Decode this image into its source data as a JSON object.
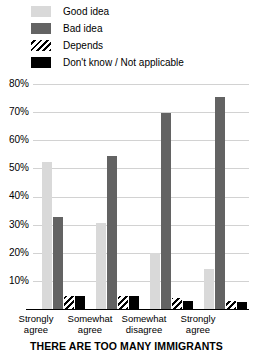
{
  "chart_data": {
    "type": "bar",
    "title": "",
    "xlabel": "THERE ARE TOO MANY IMMIGRANTS",
    "ylabel": "",
    "ylim": [
      0,
      84
    ],
    "yticks": [
      "10%",
      "20%",
      "30%",
      "40%",
      "50%",
      "60%",
      "70%",
      "80%"
    ],
    "ytick_values": [
      10,
      20,
      30,
      40,
      50,
      60,
      70,
      80
    ],
    "grid": true,
    "legend_position": "top-left",
    "categories": [
      "Strongly agree",
      "Somewhat agree",
      "Somewhat disagree",
      "Strongly agree"
    ],
    "category_lines": [
      [
        "Strongly",
        "agree"
      ],
      [
        "Somewhat",
        "agree"
      ],
      [
        "Somewhat",
        "disagree"
      ],
      [
        "Strongly",
        "agree"
      ]
    ],
    "series": [
      {
        "name": "Good idea",
        "swatch": "light-gray",
        "color": "#d9d9d9",
        "values": [
          55,
          32,
          21,
          15
        ]
      },
      {
        "name": "Bad idea",
        "swatch": "dark-gray",
        "color": "#636363",
        "values": [
          34.5,
          57,
          73,
          79
        ]
      },
      {
        "name": "Depends",
        "swatch": "diagonal-hatch",
        "color": "#000000",
        "values": [
          5,
          5,
          4,
          3
        ]
      },
      {
        "name": "Don't know / Not applicable",
        "swatch": "black",
        "color": "#000000",
        "values": [
          5,
          5,
          3,
          2.5
        ]
      }
    ]
  },
  "legend": {
    "items": [
      {
        "label": "Good idea"
      },
      {
        "label": "Bad idea"
      },
      {
        "label": "Depends"
      },
      {
        "label": "Don't know / Not applicable"
      }
    ]
  }
}
